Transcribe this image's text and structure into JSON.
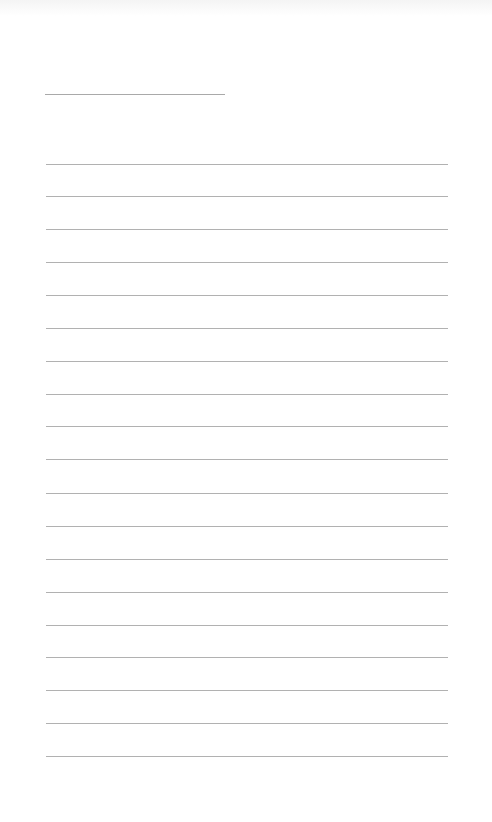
{
  "page": {
    "type": "blank-ruled-sheet",
    "background_color": "#ffffff",
    "line_color": "#a3a3a3",
    "title_line": {
      "x_start": 45,
      "x_end": 225,
      "y": 94
    },
    "ruled_lines": {
      "count": 19,
      "x_start": 46,
      "x_end": 448,
      "y_positions": [
        164,
        196,
        229,
        262,
        295,
        328,
        361,
        394,
        426,
        459,
        493,
        526,
        559,
        592,
        625,
        657,
        690,
        723,
        756
      ]
    },
    "text_content": []
  }
}
